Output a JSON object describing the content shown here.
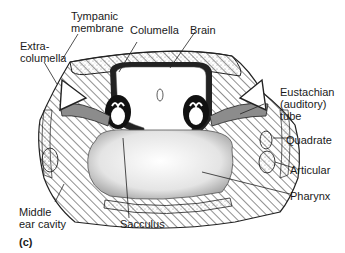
{
  "figure": {
    "panel_label": "(c)"
  },
  "labels": {
    "tympanic_membrane": "Tympanic\nmembrane",
    "columella": "Columella",
    "brain": "Brain",
    "extracolumella": "Extra-\ncolumella",
    "eustachian_tube": "Eustachian\n(auditory)\ntube",
    "quadrate": "Quadrate",
    "articular": "Articular",
    "pharynx": "Pharynx",
    "middle_ear_cavity": "Middle\near cavity",
    "sacculus": "Sacculus"
  },
  "colors": {
    "ink": "#1a1a1a",
    "background": "#ffffff",
    "stipple": "#bdbdbd"
  }
}
